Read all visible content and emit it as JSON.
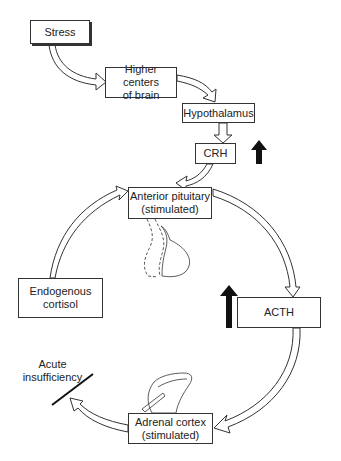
{
  "diagram": {
    "nodes": {
      "stress": {
        "label": "Stress"
      },
      "higher_centers": {
        "line1": "Higher centers",
        "line2": "of brain"
      },
      "hypothalamus": {
        "label": "Hypothalamus"
      },
      "crh": {
        "label": "CRH",
        "indicator": "increase-arrow"
      },
      "anterior_pituitary": {
        "line1": "Anterior pituitary",
        "line2": "(stimulated)"
      },
      "acth": {
        "label": "ACTH",
        "indicator": "increase-arrow"
      },
      "adrenal_cortex": {
        "line1": "Adrenal cortex",
        "line2": "(stimulated)"
      },
      "endogenous_cortisol": {
        "line1": "Endogenous",
        "line2": "cortisol"
      }
    },
    "annotations": {
      "acute_insufficiency": {
        "line1": "Acute",
        "line2": "insufficiency"
      }
    },
    "edges": [
      {
        "from": "Stress",
        "to": "Higher centers of brain"
      },
      {
        "from": "Higher centers of brain",
        "to": "Hypothalamus"
      },
      {
        "from": "Hypothalamus",
        "to": "CRH"
      },
      {
        "from": "CRH",
        "to": "Anterior pituitary (stimulated)"
      },
      {
        "from": "Anterior pituitary (stimulated)",
        "to": "ACTH"
      },
      {
        "from": "ACTH",
        "to": "Adrenal cortex (stimulated)"
      },
      {
        "from": "Adrenal cortex (stimulated)",
        "to": "Endogenous cortisol",
        "blocked_by": "Acute insufficiency"
      },
      {
        "from": "Endogenous cortisol",
        "to": "Anterior pituitary (stimulated)"
      }
    ],
    "colors": {
      "line": "#333333",
      "indicator": "#111111",
      "background": "#ffffff"
    }
  }
}
